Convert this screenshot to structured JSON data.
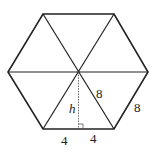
{
  "diagram": {
    "shape": "regular hexagon divided into 6 equilateral triangles",
    "labels": {
      "height": "h",
      "radius_side": "8",
      "outer_side": "8",
      "half_base_left": "4",
      "half_base_right": "4"
    },
    "colors": {
      "stroke": "#222222",
      "dotted": "#555555"
    }
  }
}
